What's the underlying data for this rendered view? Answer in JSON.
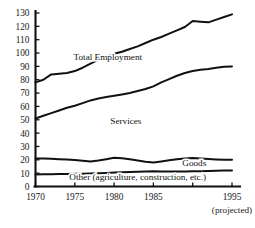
{
  "chart_data": {
    "type": "line",
    "title": "",
    "subtitle": "",
    "xlabel": "",
    "ylabel": "",
    "xlim": [
      1970,
      1995
    ],
    "ylim": [
      0,
      130
    ],
    "grid": false,
    "legend_position": "inline-labels",
    "x_tick_labels": [
      "1970",
      "1975",
      "1980",
      "1985",
      "1995"
    ],
    "x_tick_values": [
      1970,
      1975,
      1980,
      1985,
      1995
    ],
    "x_tick_values_all": [
      1970,
      1975,
      1980,
      1985,
      1990,
      1995
    ],
    "y_tick_labels": [
      "0",
      "10",
      "20",
      "30",
      "40",
      "50",
      "60",
      "70",
      "80",
      "90",
      "100",
      "110",
      "120",
      "130"
    ],
    "y_tick_values": [
      0,
      10,
      20,
      30,
      40,
      50,
      60,
      70,
      80,
      90,
      100,
      110,
      120,
      130
    ],
    "annotations": [
      {
        "text": "(projected)",
        "x": 1995,
        "y": -14,
        "name": "projected-note"
      }
    ],
    "x": [
      1970,
      1971,
      1972,
      1973,
      1974,
      1975,
      1976,
      1977,
      1978,
      1979,
      1980,
      1981,
      1982,
      1983,
      1984,
      1985,
      1986,
      1987,
      1988,
      1989,
      1990,
      1991,
      1992,
      1993,
      1994,
      1995
    ],
    "series": [
      {
        "name": "Total Employment",
        "label": "Total Employment",
        "label_x": 1979.2,
        "label_y": 94.5,
        "values": [
          78,
          80,
          84,
          84.5,
          85,
          86.5,
          89,
          92,
          95,
          97,
          99.5,
          101,
          103,
          105,
          107.5,
          110,
          112,
          114.5,
          117,
          119.5,
          124,
          123.5,
          123,
          125,
          127,
          129
        ]
      },
      {
        "name": "Services",
        "label": "Services",
        "label_x": 1981.5,
        "label_y": 46.5,
        "values": [
          51,
          53,
          55,
          57,
          59,
          60.5,
          62.5,
          64.5,
          66,
          67,
          68,
          69,
          70,
          71.5,
          73,
          75,
          78,
          80.5,
          83,
          85,
          86.5,
          87.5,
          88,
          89,
          89.8,
          90
        ]
      },
      {
        "name": "Goods",
        "label": "Goods",
        "label_x": 1990.2,
        "label_y": 15.0,
        "values": [
          21,
          21,
          20.8,
          20.5,
          20.2,
          19.8,
          19.3,
          18.8,
          19.5,
          20.5,
          21.5,
          21.2,
          20.4,
          19.4,
          18.5,
          18.0,
          18.8,
          19.6,
          20.4,
          21.0,
          21.3,
          21.0,
          20.6,
          20.3,
          20.1,
          20.0
        ]
      },
      {
        "name": "Other",
        "label": "Other (agriculture, construction, etc.)",
        "label_x": 1983.0,
        "label_y": 5.2,
        "values": [
          9,
          9.1,
          9.2,
          9.3,
          9.4,
          9.5,
          9.6,
          9.7,
          9.9,
          10.1,
          10.4,
          10.6,
          10.8,
          11.0,
          11.3,
          11.5,
          11.3,
          11.2,
          11.2,
          11.3,
          11.4,
          11.5,
          11.6,
          11.8,
          11.9,
          12.0
        ]
      }
    ],
    "colors": {
      "line": "#111111",
      "axis": "#111111",
      "background": "#ffffff",
      "text": "#1a1a1a"
    }
  }
}
